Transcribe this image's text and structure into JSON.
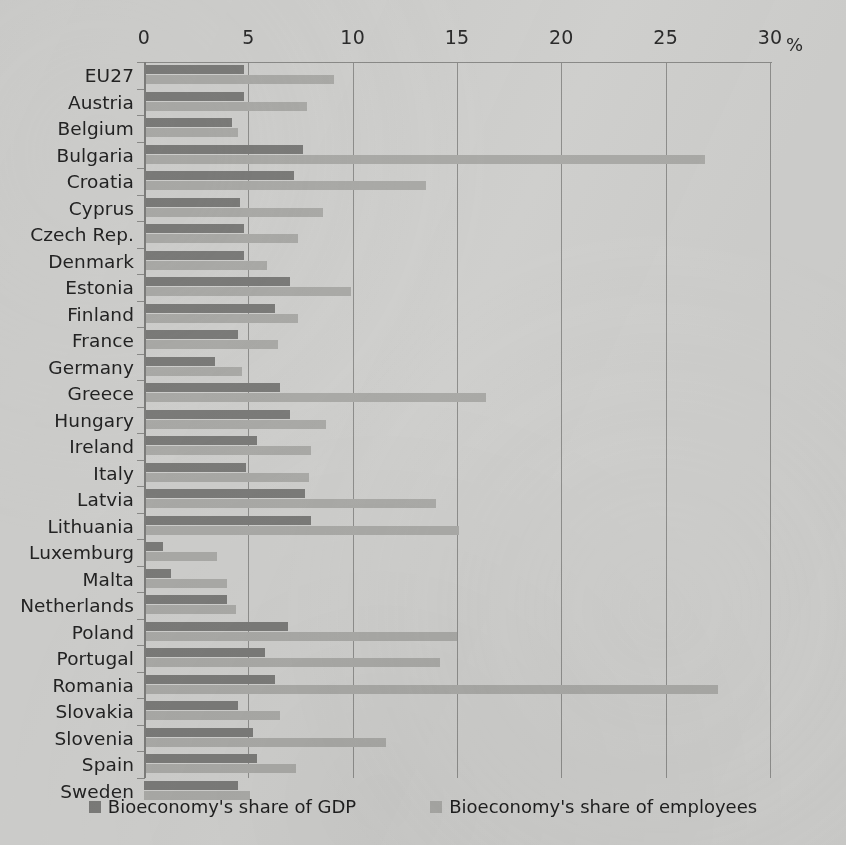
{
  "chart_data": {
    "type": "bar",
    "orientation": "horizontal",
    "title": "",
    "xlabel": "%",
    "ylabel": "",
    "xlim": [
      0,
      30
    ],
    "xticks": [
      0,
      5,
      10,
      15,
      20,
      25,
      30
    ],
    "grid": true,
    "legend_position": "bottom",
    "categories": [
      "EU27",
      "Austria",
      "Belgium",
      "Bulgaria",
      "Croatia",
      "Cyprus",
      "Czech Rep.",
      "Denmark",
      "Estonia",
      "Finland",
      "France",
      "Germany",
      "Greece",
      "Hungary",
      "Ireland",
      "Italy",
      "Latvia",
      "Lithuania",
      "Luxemburg",
      "Malta",
      "Netherlands",
      "Poland",
      "Portugal",
      "Romania",
      "Slovakia",
      "Slovenia",
      "Spain",
      "Sweden"
    ],
    "series": [
      {
        "name": "Bioeconomy's share of GDP",
        "color": "#7b7b79",
        "values": [
          4.8,
          4.8,
          4.2,
          7.6,
          7.2,
          4.6,
          4.8,
          4.8,
          7.0,
          6.3,
          4.5,
          3.4,
          6.5,
          7.0,
          5.4,
          4.9,
          7.7,
          8.0,
          0.9,
          1.3,
          4.0,
          6.9,
          5.8,
          6.3,
          4.5,
          5.2,
          5.4,
          4.5
        ]
      },
      {
        "name": "Bioeconomy's share of employees",
        "color": "#aaaaa7",
        "values": [
          9.1,
          7.8,
          4.5,
          26.9,
          13.5,
          8.6,
          7.4,
          5.9,
          9.9,
          7.4,
          6.4,
          4.7,
          16.4,
          8.7,
          8.0,
          7.9,
          14.0,
          15.1,
          3.5,
          4.0,
          4.4,
          15.0,
          14.2,
          27.5,
          6.5,
          11.6,
          7.3,
          5.1
        ]
      }
    ]
  },
  "axis": {
    "unit": "%",
    "ticks": [
      "0",
      "5",
      "10",
      "15",
      "20",
      "25",
      "30"
    ]
  },
  "legend": {
    "items": [
      {
        "label": "Bioeconomy's share of GDP",
        "swatch": "gdp"
      },
      {
        "label": "Bioeconomy's share of employees",
        "swatch": "emp"
      }
    ]
  }
}
